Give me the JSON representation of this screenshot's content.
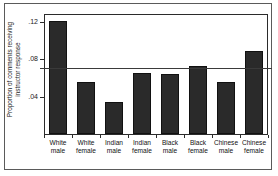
{
  "chart_data": {
    "type": "bar",
    "title": "",
    "subtitle": "",
    "xlabel": "",
    "ylabel": "Proportion of comments receiving instructor response",
    "ylabel_lines": [
      "Proportion of comments receiving",
      "instructor response"
    ],
    "categories": [
      "White male",
      "White female",
      "Indian male",
      "Indian female",
      "Black male",
      "Black female",
      "Chinese male",
      "Chinese female"
    ],
    "category_lines": [
      [
        "White",
        "male"
      ],
      [
        "White",
        "female"
      ],
      [
        "Indian",
        "male"
      ],
      [
        "Indian",
        "female"
      ],
      [
        "Black",
        "male"
      ],
      [
        "Black",
        "female"
      ],
      [
        "Chinese",
        "male"
      ],
      [
        "Chinese",
        "female"
      ]
    ],
    "values": [
      0.121,
      0.056,
      0.034,
      0.065,
      0.064,
      0.073,
      0.056,
      0.089
    ],
    "ylim": [
      0,
      0.128
    ],
    "ytick_values": [
      0.04,
      0.08,
      0.12
    ],
    "ytick_labels": [
      ".04",
      ".08",
      ".12"
    ],
    "grid": false,
    "legend": null,
    "reference_line": {
      "value": 0.07,
      "orientation": "horizontal",
      "label": ""
    },
    "bar_color": "#2a2a2a",
    "bar_edge_color": "#111111",
    "axis_color": "#2b2b2b",
    "background_color": "#ffffff"
  }
}
